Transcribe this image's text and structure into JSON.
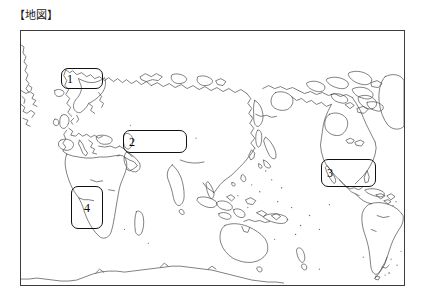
{
  "heading": {
    "text": "【地図】"
  },
  "map": {
    "name": "world-map",
    "projection": "pacific-centered",
    "frame": {
      "x": 20,
      "y": 30,
      "width": 385,
      "height": 256
    },
    "stroke_color": "#3d3d3d",
    "background_color": "#ffffff",
    "regions": [
      {
        "number": "1",
        "name": "region-box-1",
        "area_hint": "Northern Europe / Scandinavia",
        "x": 60,
        "y": 67,
        "width": 42,
        "height": 21,
        "orientation": "wide"
      },
      {
        "number": "2",
        "name": "region-box-2",
        "area_hint": "Central Asia / Inland China",
        "x": 122,
        "y": 129,
        "width": 64,
        "height": 23,
        "orientation": "wide"
      },
      {
        "number": "3",
        "name": "region-box-3",
        "area_hint": "Central America / Northern South America",
        "x": 320,
        "y": 158,
        "width": 55,
        "height": 28,
        "orientation": "wide"
      },
      {
        "number": "4",
        "name": "region-box-4",
        "area_hint": "Southern Africa",
        "x": 70,
        "y": 185,
        "width": 32,
        "height": 43,
        "orientation": "tall"
      }
    ]
  }
}
